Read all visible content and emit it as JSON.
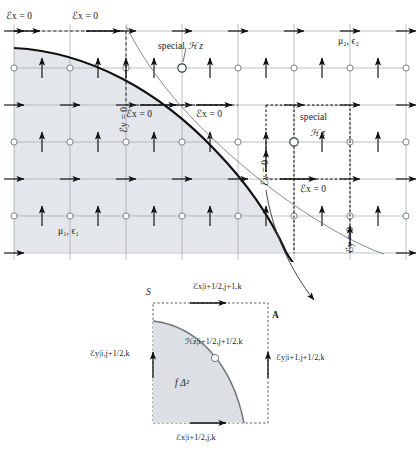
{
  "figure": {
    "type": "fdtd-yee-grid-staircase-diagram",
    "colors": {
      "region_fill": "#e3e6ea",
      "grid_line": "#9aa0a6",
      "interface_curve": "#111111",
      "contour_path": "#2b2b2b",
      "arrow": "#1a1a1a",
      "node_circle": "#6f7479",
      "inset_fill": "#dcdfe3"
    },
    "main": {
      "material_inside": "μ₁, ϵ₁",
      "material_outside": "μ₂, ϵ₂",
      "special_label_top": "special",
      "special_hz_top": "ℋ z",
      "special_label_right": "special",
      "special_hz_right": "ℋ z",
      "e_labels": [
        {
          "id": "ex-top-left",
          "text": "ℰx = 0"
        },
        {
          "id": "ex-top-mid",
          "text": "ℰx = 0"
        },
        {
          "id": "ey-left-vert",
          "text": "ℰy = 0"
        },
        {
          "id": "ex-mid-left",
          "text": "ℰx = 0"
        },
        {
          "id": "ex-mid-right",
          "text": "ℰx = 0"
        },
        {
          "id": "ey-right-vert",
          "text": "ℰy = 0"
        },
        {
          "id": "ex-lower-right",
          "text": "ℰx = 0"
        },
        {
          "id": "ey-far-right",
          "text": "ℰy = 0"
        }
      ]
    },
    "inset": {
      "area_symbol": "S",
      "corner_symbol": "A",
      "cell_area": "f Δ²",
      "ex_top": "ℰx|i+1/2,j+1,k",
      "ex_bottom": "ℰx|i+1/2,j,k",
      "ey_left": "ℰy|i,j+1/2,k",
      "ey_right": "ℰy|i+1,j+1/2,k",
      "hz_center": "ℋz|i+1/2,j+1/2,k"
    }
  }
}
